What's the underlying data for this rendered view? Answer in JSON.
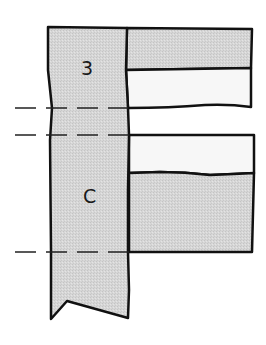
{
  "diagram": {
    "labels": {
      "upper_region": "3",
      "lower_region": "C"
    },
    "colors": {
      "stroke": "#111111",
      "gray_fill": "#d9d9d9",
      "white_fill": "#f7f7f7",
      "dash": "#222222"
    },
    "regions": [
      {
        "name": "vertical-strip",
        "fill": "gray"
      },
      {
        "name": "top-right-gray-band",
        "fill": "gray"
      },
      {
        "name": "top-right-white-band",
        "fill": "white"
      },
      {
        "name": "bottom-right-white-band",
        "fill": "white"
      },
      {
        "name": "bottom-right-gray-band",
        "fill": "gray"
      }
    ],
    "dashed_lines": [
      {
        "name": "upper-dashed-line"
      },
      {
        "name": "middle-dashed-line"
      },
      {
        "name": "lower-dashed-line"
      }
    ]
  }
}
